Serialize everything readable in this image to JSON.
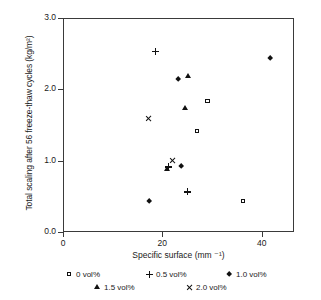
{
  "chart_data": {
    "type": "scatter",
    "title": "",
    "xlabel": "Specific surface (mm ⁻¹)",
    "ylabel": "Total scaling after 56 freeze-thaw cycles (kg/m²)",
    "xlim": [
      0,
      46.5
    ],
    "ylim": [
      0.0,
      3.0
    ],
    "xticks": [
      0,
      20,
      40
    ],
    "xtick_labels": [
      "0",
      "20",
      "40"
    ],
    "yticks": [
      0.0,
      1.0,
      2.0,
      3.0
    ],
    "ytick_labels": [
      "0.0",
      "1.0",
      "2.0",
      "3.0"
    ],
    "grid": false,
    "frame": "box",
    "legend_position": "below-axes",
    "series": [
      {
        "name": "0 vol%",
        "marker": "square",
        "points": [
          {
            "x": 28.9,
            "y": 1.85
          },
          {
            "x": 26.8,
            "y": 1.43
          },
          {
            "x": 36.0,
            "y": 0.45
          }
        ]
      },
      {
        "name": "0.5 vol%",
        "marker": "plus",
        "points": [
          {
            "x": 18.4,
            "y": 2.55
          },
          {
            "x": 21.0,
            "y": 0.93
          },
          {
            "x": 24.8,
            "y": 0.58
          }
        ]
      },
      {
        "name": "1.0 vol%",
        "marker": "diamond",
        "points": [
          {
            "x": 41.6,
            "y": 2.45
          },
          {
            "x": 23.0,
            "y": 2.15
          },
          {
            "x": 23.6,
            "y": 0.94
          },
          {
            "x": 17.2,
            "y": 0.45
          }
        ]
      },
      {
        "name": "1.5 vol%",
        "marker": "triangle",
        "points": [
          {
            "x": 25.0,
            "y": 2.2
          },
          {
            "x": 24.4,
            "y": 1.75
          },
          {
            "x": 20.8,
            "y": 0.9
          }
        ]
      },
      {
        "name": "2.0 vol%",
        "marker": "ex",
        "points": [
          {
            "x": 17.0,
            "y": 1.6
          },
          {
            "x": 21.8,
            "y": 1.02
          }
        ]
      }
    ],
    "legend": [
      {
        "label": "0 vol%",
        "marker": "square"
      },
      {
        "label": "0.5 vol%",
        "marker": "plus"
      },
      {
        "label": "1.0 vol%",
        "marker": "diamond"
      },
      {
        "label": "1.5 vol%",
        "marker": "triangle"
      },
      {
        "label": "2.0 vol%",
        "marker": "ex"
      }
    ]
  }
}
